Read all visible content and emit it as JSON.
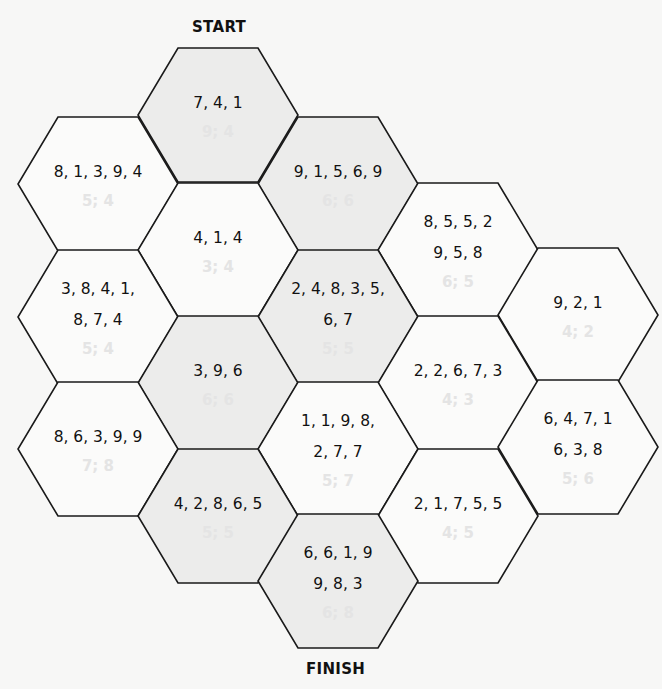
{
  "labels": {
    "start": "START",
    "finish": "FINISH"
  },
  "colors": {
    "shaded": "#ececeb",
    "plain": "#fbfbfa",
    "stroke": "#1a1a1a",
    "hint": "#e4e4e4"
  },
  "hexes": [
    {
      "id": "h0",
      "col": 1,
      "x": 138,
      "y": 48,
      "shaded": true,
      "numbers": "7, 4, 1",
      "hint": "9; 4"
    },
    {
      "id": "h1",
      "col": 0,
      "x": 18,
      "y": 117,
      "shaded": false,
      "numbers": "8, 1, 3, 9, 4",
      "hint": "5; 4"
    },
    {
      "id": "h2",
      "col": 2,
      "x": 258,
      "y": 117,
      "shaded": true,
      "numbers": "9, 1, 5, 6, 9",
      "hint": "6; 6"
    },
    {
      "id": "h3",
      "col": 1,
      "x": 138,
      "y": 183,
      "shaded": false,
      "numbers": "4, 1, 4",
      "hint": "3; 4"
    },
    {
      "id": "h4",
      "col": 3,
      "x": 378,
      "y": 183,
      "shaded": false,
      "numbers": "8, 5, 5, 2\n9, 5, 8",
      "hint": "6; 5"
    },
    {
      "id": "h5",
      "col": 0,
      "x": 18,
      "y": 250,
      "shaded": false,
      "numbers": "3, 8, 4, 1,\n8, 7, 4",
      "hint": "5; 4"
    },
    {
      "id": "h6",
      "col": 2,
      "x": 258,
      "y": 250,
      "shaded": true,
      "numbers": "2, 4, 8, 3, 5,\n6, 7",
      "hint": "5; 5"
    },
    {
      "id": "h7",
      "col": 4,
      "x": 498,
      "y": 248,
      "shaded": false,
      "numbers": "9, 2, 1",
      "hint": "4; 2"
    },
    {
      "id": "h8",
      "col": 1,
      "x": 138,
      "y": 316,
      "shaded": true,
      "numbers": "3, 9, 6",
      "hint": "6; 6"
    },
    {
      "id": "h9",
      "col": 3,
      "x": 378,
      "y": 316,
      "shaded": false,
      "numbers": "2, 2, 6, 7, 3",
      "hint": "4; 3"
    },
    {
      "id": "h10",
      "col": 0,
      "x": 18,
      "y": 382,
      "shaded": false,
      "numbers": "8, 6, 3, 9, 9",
      "hint": "7; 8"
    },
    {
      "id": "h11",
      "col": 2,
      "x": 258,
      "y": 382,
      "shaded": false,
      "numbers": "1, 1, 9, 8,\n2, 7, 7",
      "hint": "5; 7"
    },
    {
      "id": "h12",
      "col": 4,
      "x": 498,
      "y": 380,
      "shaded": false,
      "numbers": "6, 4, 7, 1\n6, 3, 8",
      "hint": "5; 6"
    },
    {
      "id": "h13",
      "col": 1,
      "x": 138,
      "y": 449,
      "shaded": true,
      "numbers": "4, 2, 8, 6, 5",
      "hint": "5; 5"
    },
    {
      "id": "h14",
      "col": 3,
      "x": 378,
      "y": 449,
      "shaded": false,
      "numbers": "2, 1, 7, 5, 5",
      "hint": "4; 5"
    },
    {
      "id": "h15",
      "col": 2,
      "x": 258,
      "y": 514,
      "shaded": true,
      "numbers": "6, 6, 1, 9\n9, 8, 3",
      "hint": "6; 8"
    }
  ]
}
